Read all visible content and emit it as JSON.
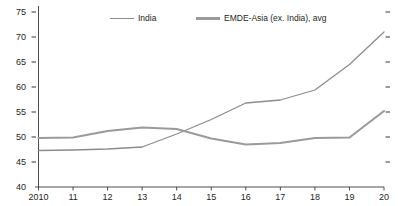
{
  "chart_data": {
    "type": "line",
    "title": "",
    "subtitle": "",
    "xlabel": "",
    "ylabel": "",
    "x": [
      "2010",
      "11",
      "12",
      "13",
      "14",
      "15",
      "16",
      "17",
      "18",
      "19",
      "20"
    ],
    "xlim": [
      2010,
      2020
    ],
    "ylim": [
      40,
      75
    ],
    "yticks": [
      40,
      45,
      50,
      55,
      60,
      65,
      70,
      75
    ],
    "ytick_labels": [
      "40",
      "45",
      "50",
      "55",
      "60",
      "65",
      "70",
      "75"
    ],
    "xtick_labels": [
      "2010",
      "11",
      "12",
      "13",
      "14",
      "15",
      "16",
      "17",
      "18",
      "19",
      "20"
    ],
    "grid": false,
    "legend_position": "top-center",
    "right_axis_ticks": true,
    "series": [
      {
        "name": "India",
        "color": "#8c8c8c",
        "width": 1.3,
        "values": [
          47.3,
          47.4,
          47.6,
          48.0,
          50.6,
          53.5,
          56.8,
          57.4,
          59.4,
          64.5,
          71.0
        ]
      },
      {
        "name": "EMDE-Asia (ex. India), avg",
        "color": "#9a9a9a",
        "width": 2.1,
        "values": [
          49.8,
          49.9,
          51.2,
          51.9,
          51.6,
          49.7,
          48.5,
          48.8,
          49.8,
          49.9,
          55.2
        ]
      }
    ]
  },
  "legend": {
    "items": [
      {
        "label": "India",
        "color": "#8c8c8c",
        "width": 1.3
      },
      {
        "label": "EMDE-Asia (ex. India), avg",
        "color": "#9a9a9a",
        "width": 2.1
      }
    ]
  },
  "axis": {
    "color": "#231f20",
    "tick_color": "#231f20"
  }
}
